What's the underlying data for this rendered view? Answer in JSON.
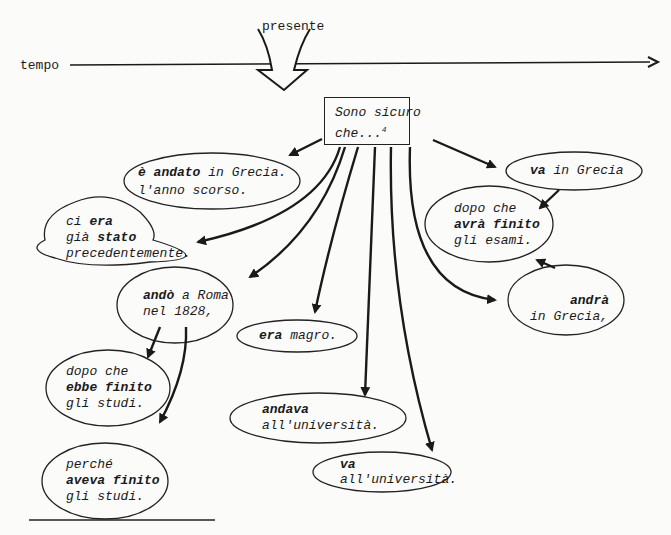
{
  "timeline": {
    "axis_label": "tempo",
    "present_label": "presente"
  },
  "center": {
    "line1": "Sono sicuro",
    "line2": "che...",
    "footnote": "4"
  },
  "bubbles": {
    "andato": {
      "bold": "è andato",
      "rest1": " in Grecia.",
      "line2": "l'anno scorso."
    },
    "era_stato": {
      "l1a": "ci ",
      "l1b": "era",
      "l2a": "già ",
      "l2b": "stato",
      "l3": "precedentemente."
    },
    "ando": {
      "bold": "andò",
      "rest1": " a Roma",
      "line2": "nel 1828,"
    },
    "ebbe": {
      "l1": "dopo che",
      "l2": "ebbe finito",
      "l3": "gli studi."
    },
    "aveva": {
      "l1": "perché",
      "l2": "aveva finito",
      "l3": "gli studi."
    },
    "era_magro": {
      "bold": "era",
      "rest": " magro."
    },
    "andava": {
      "l1": "andava",
      "l2": "all'università."
    },
    "va_uni": {
      "l1": "va",
      "l2": "all'università."
    },
    "va_grecia": {
      "bold": "va",
      "rest": " in Grecia"
    },
    "avra": {
      "l1": "dopo che",
      "l2": "avrà finito",
      "l3": "gli esami."
    },
    "andra": {
      "l1": "andrà",
      "l2": "in Grecia,"
    }
  }
}
